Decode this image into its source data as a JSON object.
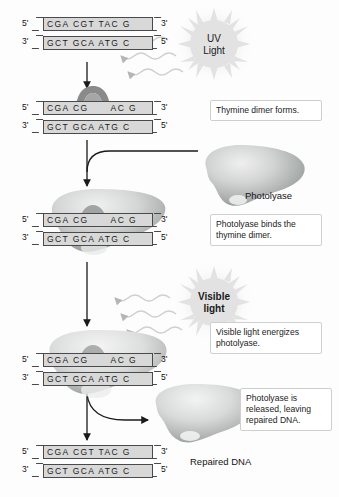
{
  "figure": {
    "accent_color": "#4a4a4a",
    "strand_fill": "#d8d8d8",
    "protein_color": "#b9bcbb"
  },
  "dna_steps": [
    {
      "id": "dna-intact",
      "top_end_left": "5'",
      "top_end_right": "3'",
      "bottom_end_left": "3'",
      "bottom_end_right": "5'",
      "top_sequence": "CGA CGT TAC G",
      "bottom_sequence": "GCT GCA ATG C",
      "has_dimer": false
    },
    {
      "id": "dna-dimer-formed",
      "top_end_left": "5'",
      "top_end_right": "3'",
      "bottom_end_left": "3'",
      "bottom_end_right": "5'",
      "top_sequence": "CGA CG      AC G",
      "bottom_sequence": "GCT GCA ATG C",
      "has_dimer": true
    },
    {
      "id": "dna-photolyase-bound",
      "top_end_left": "5'",
      "top_end_right": "3'",
      "bottom_end_left": "3'",
      "bottom_end_right": "5'",
      "top_sequence": "CGA CG      AC G",
      "bottom_sequence": "GCT GCA ATG C",
      "has_dimer": true
    },
    {
      "id": "dna-energized",
      "top_end_left": "5'",
      "top_end_right": "3'",
      "bottom_end_left": "3'",
      "bottom_end_right": "5'",
      "top_sequence": "CGA CG      AC G",
      "bottom_sequence": "GCT GCA ATG C",
      "has_dimer": true
    },
    {
      "id": "dna-repaired",
      "top_end_left": "5'",
      "top_end_right": "3'",
      "bottom_end_left": "3'",
      "bottom_end_right": "5'",
      "top_sequence": "CGA CGT TAC G",
      "bottom_sequence": "GCT GCA ATG C",
      "has_dimer": false
    }
  ],
  "light_sources": [
    {
      "id": "uv-light",
      "line1": "UV",
      "line2": "Light",
      "bold": false
    },
    {
      "id": "visible-light",
      "line1": "Visible",
      "line2": "light",
      "bold": true
    }
  ],
  "callouts": [
    {
      "id": "callout-dimer-forms",
      "text": "Thymine dimer forms."
    },
    {
      "id": "callout-photolyase-binds",
      "text": "Photolyase binds the thymine dimer."
    },
    {
      "id": "callout-light-energizes",
      "text": "Visible light energizes photolyase."
    },
    {
      "id": "callout-photolyase-released",
      "text": "Photolyase is released, leaving repaired DNA."
    }
  ],
  "labels": {
    "photolyase": "Photolyase",
    "repaired_dna": "Repaired DNA"
  }
}
